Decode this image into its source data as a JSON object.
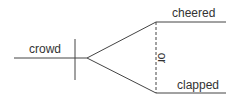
{
  "diagram": {
    "type": "sentence-diagram",
    "subject": {
      "word": "crowd"
    },
    "predicates": [
      {
        "word": "cheered"
      },
      {
        "word": "clapped"
      }
    ],
    "conjunction": {
      "word": "or"
    },
    "colors": {
      "line": "#444444",
      "text": "#333333",
      "background": "#ffffff"
    }
  }
}
